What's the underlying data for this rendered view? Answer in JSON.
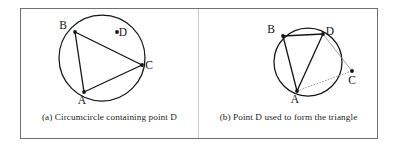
{
  "figure": {
    "background_color": "#ffffff",
    "frame_color": "#6f6f6f",
    "stroke_color": "#141414",
    "faint_stroke_color": "#8a8a8a"
  },
  "panels": [
    {
      "id": "a",
      "caption": "(a) Circumcircle containing point D",
      "circle": {
        "cx": 81,
        "cy": 49,
        "r": 43
      },
      "points": [
        {
          "label": "A",
          "x": 63,
          "y": 83,
          "label_dx": -2,
          "label_dy": 12,
          "on_circle": true
        },
        {
          "label": "B",
          "x": 54,
          "y": 23,
          "label_dx": -12,
          "label_dy": -3,
          "on_circle": true
        },
        {
          "label": "C",
          "x": 121,
          "y": 56,
          "label_dx": 7,
          "label_dy": 4,
          "on_circle": true
        },
        {
          "label": "D",
          "x": 96,
          "y": 23,
          "label_dx": 6,
          "label_dy": 4,
          "on_circle": false
        }
      ],
      "edges": [
        {
          "from": "A",
          "to": "B",
          "style": "solid"
        },
        {
          "from": "B",
          "to": "C",
          "style": "solid"
        },
        {
          "from": "C",
          "to": "A",
          "style": "solid"
        }
      ]
    },
    {
      "id": "b",
      "caption": "(b) Point D used to form the triangle",
      "circle": {
        "cx": 110,
        "cy": 53,
        "r": 34
      },
      "points": [
        {
          "label": "A",
          "x": 99,
          "y": 82,
          "label_dx": -2,
          "label_dy": 12,
          "on_circle": true
        },
        {
          "label": "B",
          "x": 85,
          "y": 27,
          "label_dx": -12,
          "label_dy": -3,
          "on_circle": true
        },
        {
          "label": "D",
          "x": 125,
          "y": 25,
          "label_dx": 7,
          "label_dy": 1,
          "on_circle": true
        },
        {
          "label": "C",
          "x": 154,
          "y": 62,
          "label_dx": 0,
          "label_dy": 13,
          "on_circle": false
        }
      ],
      "edges": [
        {
          "from": "A",
          "to": "B",
          "style": "solid"
        },
        {
          "from": "B",
          "to": "D",
          "style": "solid"
        },
        {
          "from": "D",
          "to": "A",
          "style": "solid"
        },
        {
          "from": "D",
          "to": "C",
          "style": "faint"
        },
        {
          "from": "A",
          "to": "C",
          "style": "dotted"
        }
      ]
    }
  ]
}
